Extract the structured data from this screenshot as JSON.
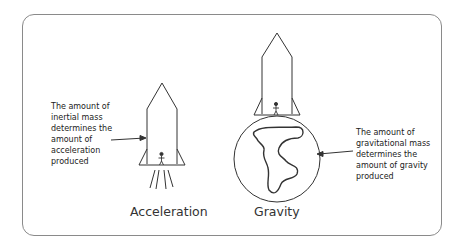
{
  "diagram": {
    "panels": [
      {
        "id": "acceleration",
        "caption": "Acceleration",
        "note_lines": [
          "The amount of",
          "inertial mass",
          "determines the",
          "amount of",
          "acceleration",
          "produced"
        ]
      },
      {
        "id": "gravity",
        "caption": "Gravity",
        "note_lines": [
          "The amount of",
          "gravitational mass",
          "determines the",
          "amount of gravity",
          "produced"
        ]
      }
    ],
    "icons": {
      "left_rocket": "rocket-icon",
      "right_rocket": "rocket-icon",
      "person": "stick-figure-icon",
      "planet": "planet-icon",
      "exhaust": "exhaust-lines-icon"
    },
    "colors": {
      "stroke": "#333333",
      "frame": "#8a8a8a",
      "text": "#222222"
    }
  }
}
